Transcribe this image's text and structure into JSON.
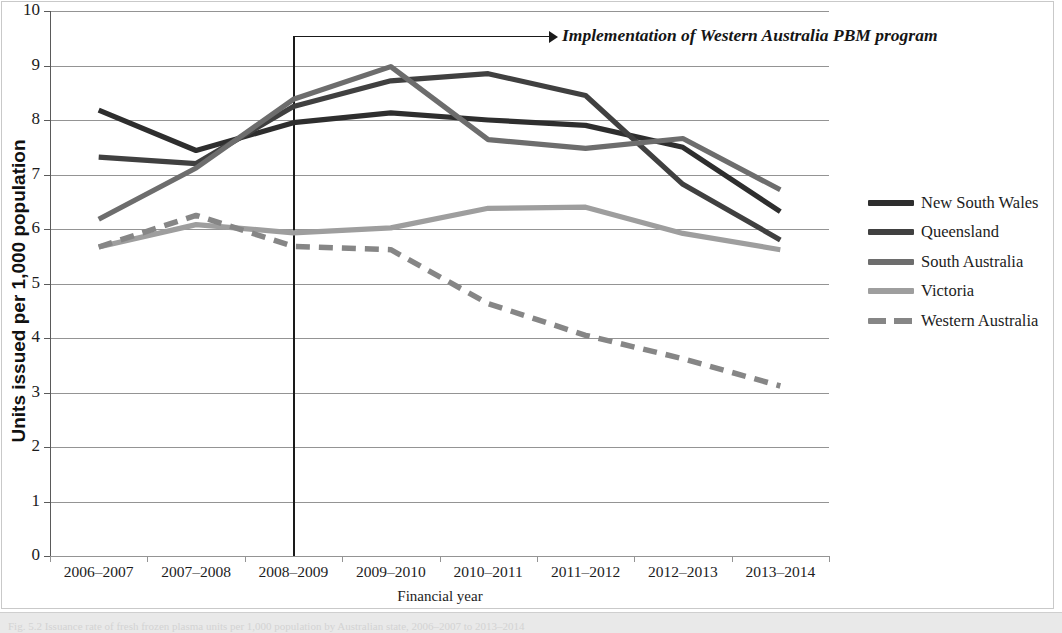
{
  "figure": {
    "caption": "Fig. 5.2  Issuance rate of fresh frozen plasma units per 1,000 population by Australian state, 2006–2007 to 2013–2014"
  },
  "annotation": {
    "text": "Implementation of Western Australia PBM program",
    "at_category": "2008–2009"
  },
  "axes": {
    "y_title": "Units issued per 1,000 population",
    "x_title": "Financial year",
    "y_ticks": [
      "10",
      "9",
      "8",
      "7",
      "6",
      "5",
      "4",
      "3",
      "2",
      "1",
      "0"
    ],
    "y_min": 0,
    "y_max": 10
  },
  "legend": {
    "position": "right",
    "items": [
      {
        "label": "New South Wales",
        "color": "#2e2e2e",
        "style": "solid"
      },
      {
        "label": "Queensland",
        "color": "#404040",
        "style": "solid"
      },
      {
        "label": "South Australia",
        "color": "#6d6d6d",
        "style": "solid"
      },
      {
        "label": "Victoria",
        "color": "#9e9e9e",
        "style": "solid"
      },
      {
        "label": "Western Australia",
        "color": "#868686",
        "style": "dashed"
      }
    ]
  },
  "chart_data": {
    "type": "line",
    "title": "",
    "xlabel": "Financial year",
    "ylabel": "Units issued per 1,000 population",
    "ylim": [
      0,
      10
    ],
    "grid": true,
    "legend_position": "right",
    "categories": [
      "2006–2007",
      "2007–2008",
      "2008–2009",
      "2009–2010",
      "2010–2011",
      "2011–2012",
      "2012–2013",
      "2013–2014"
    ],
    "series": [
      {
        "name": "New South Wales",
        "color": "#2e2e2e",
        "style": "solid",
        "values": [
          8.18,
          7.44,
          7.95,
          8.13,
          8.0,
          7.9,
          7.5,
          6.32
        ]
      },
      {
        "name": "Queensland",
        "color": "#404040",
        "style": "solid",
        "values": [
          7.32,
          7.2,
          8.25,
          8.72,
          8.85,
          8.45,
          6.82,
          5.8
        ]
      },
      {
        "name": "South Australia",
        "color": "#6d6d6d",
        "style": "solid",
        "values": [
          6.18,
          7.12,
          8.38,
          8.98,
          7.64,
          7.48,
          7.66,
          6.72
        ]
      },
      {
        "name": "Victoria",
        "color": "#9e9e9e",
        "style": "solid",
        "values": [
          5.67,
          6.08,
          5.93,
          6.02,
          6.38,
          6.4,
          5.92,
          5.62
        ]
      },
      {
        "name": "Western Australia",
        "color": "#868686",
        "style": "dashed",
        "values": [
          5.67,
          6.25,
          5.68,
          5.62,
          4.63,
          4.05,
          3.62,
          3.12
        ]
      }
    ],
    "annotation": {
      "text": "Implementation of Western Australia PBM program",
      "at_category": "2008–2009"
    }
  }
}
